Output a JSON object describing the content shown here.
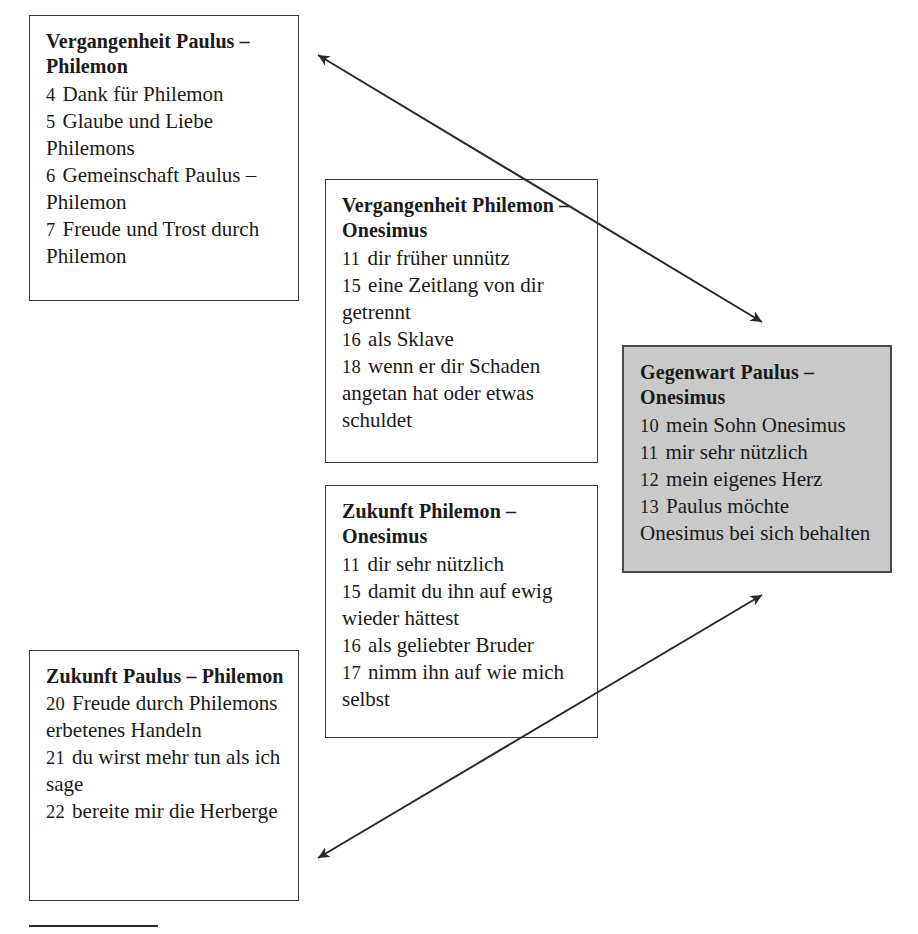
{
  "figure": {
    "kind": "structure-diagram",
    "colors": {
      "page_background": "#ffffff",
      "box_border": "#3b3b3b",
      "shaded_box_fill": "#c9c9c9",
      "shaded_box_border": "#4a4a4a",
      "arrow": "#2a2a2a",
      "text": "#1a1a1a"
    }
  },
  "boxes": [
    {
      "id": "past-paulus-philemon",
      "title": "Vergangenheit Paulus – Philemon",
      "shaded": false,
      "entries": [
        {
          "num": "4",
          "text": "Dank für Philemon"
        },
        {
          "num": "5",
          "text": "Glaube und Liebe Philemons"
        },
        {
          "num": "6",
          "text": "Gemeinschaft Paulus – Philemon"
        },
        {
          "num": "7",
          "text": "Freude und Trost durch Philemon"
        }
      ]
    },
    {
      "id": "past-philemon-onesimus",
      "title": "Vergangenheit Philemon – Onesimus",
      "shaded": false,
      "entries": [
        {
          "num": "11",
          "text": "dir früher unnütz"
        },
        {
          "num": "15",
          "text": "eine Zeitlang von dir getrennt"
        },
        {
          "num": "16",
          "text": "als Sklave"
        },
        {
          "num": "18",
          "text": "wenn er dir Schaden angetan hat oder etwas schuldet"
        }
      ]
    },
    {
      "id": "present-paulus-onesimus",
      "title": "Gegenwart Paulus – Onesimus",
      "shaded": true,
      "entries": [
        {
          "num": "10",
          "text": "mein Sohn Onesimus"
        },
        {
          "num": "11",
          "text": "mir sehr nützlich"
        },
        {
          "num": "12",
          "text": "mein eigenes Herz"
        },
        {
          "num": "13",
          "text": "Paulus möchte Onesimus bei sich behalten"
        }
      ]
    },
    {
      "id": "future-philemon-onesimus",
      "title": "Zukunft Philemon – Onesimus",
      "shaded": false,
      "entries": [
        {
          "num": "11",
          "text": "dir sehr nützlich"
        },
        {
          "num": "15",
          "text": "damit du ihn auf ewig wieder hättest"
        },
        {
          "num": "16",
          "text": "als geliebter Bruder"
        },
        {
          "num": "17",
          "text": "nimm ihn auf wie mich selbst"
        }
      ]
    },
    {
      "id": "future-paulus-philemon",
      "title": "Zukunft Paulus – Philemon",
      "shaded": false,
      "entries": [
        {
          "num": "20",
          "text": "Freude durch Philemons erbetenes Handeln"
        },
        {
          "num": "21",
          "text": "du wirst mehr tun als ich sage"
        },
        {
          "num": "22",
          "text": "bereite mir die Herberge"
        }
      ]
    }
  ],
  "arrows": [
    {
      "id": "arrow-upper",
      "from": "past-paulus-philemon",
      "to": "present-paulus-onesimus",
      "double_headed": true,
      "x1": 318,
      "y1": 55,
      "x2": 762,
      "y2": 322
    },
    {
      "id": "arrow-lower",
      "from": "future-paulus-philemon",
      "to": "present-paulus-onesimus",
      "double_headed": true,
      "x1": 318,
      "y1": 858,
      "x2": 762,
      "y2": 595
    }
  ]
}
